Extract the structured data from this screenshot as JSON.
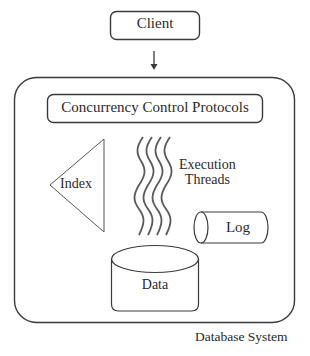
{
  "figure": {
    "type": "architecture-diagram",
    "cropped_header_text": ""
  },
  "nodes": {
    "client": {
      "label": "Client",
      "shape": "rounded-rectangle"
    },
    "concurrency_control": {
      "label": "Concurrency Control Protocols",
      "shape": "rounded-rectangle"
    },
    "index": {
      "label": "Index",
      "shape": "triangle"
    },
    "threads": {
      "label_line1": "Execution",
      "label_line2": "Threads",
      "shape": "wavy-lines",
      "count": 4
    },
    "log": {
      "label": "Log",
      "shape": "horizontal-cylinder"
    },
    "data": {
      "label": "Data",
      "shape": "vertical-cylinder"
    }
  },
  "container": {
    "label": "Database System",
    "shape": "rounded-rectangle"
  },
  "edges": [
    {
      "from": "Client",
      "to": "Database System",
      "style": "arrow-down"
    }
  ],
  "colors": {
    "stroke": "#3a3a3a",
    "text": "#2a2a2a",
    "background": "#ffffff"
  }
}
